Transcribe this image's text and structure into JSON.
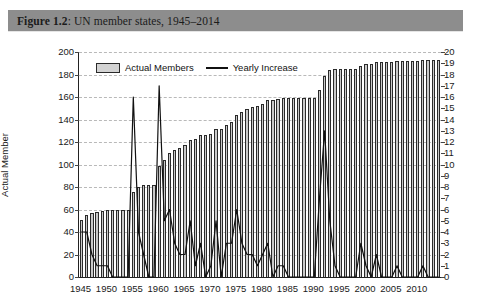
{
  "figure": {
    "label": "Figure 1.2",
    "separator": ": ",
    "caption": "UN member states, 1945–2014",
    "title_full": "Figure 1.2: UN member states, 1945–2014",
    "banner_color": "#8d8d8d"
  },
  "legend": {
    "position": "top-left-inside",
    "items": [
      {
        "label": "Actual Members",
        "marker": "bar-swatch-icon",
        "color": "#d3d3d3"
      },
      {
        "label": "Yearly Increase",
        "marker": "line-segment-icon",
        "color": "#111111"
      }
    ]
  },
  "axes": {
    "left": {
      "title": "Actual Member",
      "ticks": [
        0,
        20,
        40,
        60,
        80,
        100,
        120,
        140,
        160,
        180,
        200
      ],
      "min": 0,
      "max": 200
    },
    "right": {
      "title": "Yearly Increase",
      "ticks": [
        0,
        1,
        2,
        3,
        4,
        5,
        6,
        7,
        8,
        9,
        10,
        11,
        12,
        13,
        14,
        15,
        16,
        17,
        18,
        19,
        20
      ],
      "min": 0,
      "max": 20
    },
    "bottom": {
      "title": "",
      "ticks": [
        1945,
        1950,
        1955,
        1960,
        1965,
        1970,
        1975,
        1980,
        1985,
        1990,
        1995,
        2000,
        2005,
        2010
      ],
      "min": 1945,
      "max": 2014
    }
  },
  "chart_data": {
    "type": "bar",
    "title": "UN member states, 1945–2014",
    "xlabel": "",
    "ylabel": "Actual Member",
    "y2label": "Yearly Increase",
    "ylim": [
      0,
      200
    ],
    "y2lim": [
      0,
      20
    ],
    "grid": true,
    "legend_position": "upper left",
    "categories": [
      1945,
      1946,
      1947,
      1948,
      1949,
      1950,
      1951,
      1952,
      1953,
      1954,
      1955,
      1956,
      1957,
      1958,
      1959,
      1960,
      1961,
      1962,
      1963,
      1964,
      1965,
      1966,
      1967,
      1968,
      1969,
      1970,
      1971,
      1972,
      1973,
      1974,
      1975,
      1976,
      1977,
      1978,
      1979,
      1980,
      1981,
      1982,
      1983,
      1984,
      1985,
      1986,
      1987,
      1988,
      1989,
      1990,
      1991,
      1992,
      1993,
      1994,
      1995,
      1996,
      1997,
      1998,
      1999,
      2000,
      2001,
      2002,
      2003,
      2004,
      2005,
      2006,
      2007,
      2008,
      2009,
      2010,
      2011,
      2012,
      2013,
      2014
    ],
    "series": [
      {
        "name": "Actual Members",
        "type": "bar",
        "axis": "left",
        "color": "#c9c9c9",
        "edge_color": "#2a2a2a",
        "values": [
          51,
          55,
          57,
          58,
          59,
          60,
          60,
          60,
          60,
          60,
          76,
          80,
          82,
          82,
          82,
          99,
          104,
          110,
          113,
          115,
          117,
          122,
          123,
          126,
          126,
          127,
          132,
          132,
          135,
          138,
          144,
          147,
          149,
          151,
          152,
          154,
          157,
          157,
          158,
          159,
          159,
          159,
          159,
          159,
          159,
          159,
          166,
          179,
          184,
          185,
          185,
          185,
          185,
          185,
          188,
          189,
          189,
          191,
          191,
          191,
          191,
          192,
          192,
          192,
          192,
          192,
          193,
          193,
          193,
          193
        ]
      },
      {
        "name": "Yearly Increase",
        "type": "line",
        "axis": "right",
        "color": "#111111",
        "values": [
          4,
          4,
          2,
          1,
          1,
          1,
          0,
          0,
          0,
          0,
          16,
          4,
          2,
          0,
          0,
          17,
          5,
          6,
          3,
          2,
          2,
          5,
          1,
          3,
          0,
          1,
          5,
          0,
          3,
          3,
          6,
          3,
          2,
          2,
          1,
          2,
          3,
          0,
          1,
          1,
          0,
          0,
          0,
          0,
          0,
          0,
          7,
          13,
          5,
          1,
          0,
          0,
          0,
          0,
          3,
          1,
          0,
          2,
          0,
          0,
          0,
          1,
          0,
          0,
          0,
          0,
          1,
          0,
          0,
          0
        ]
      }
    ]
  }
}
